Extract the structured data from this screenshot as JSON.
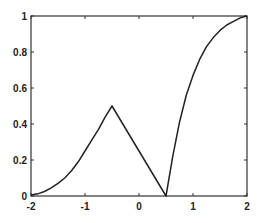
{
  "chart_data": {
    "type": "line",
    "title": "",
    "xlabel": "",
    "ylabel": "",
    "xlim": [
      -2,
      2
    ],
    "ylim": [
      0,
      1
    ],
    "grid": false,
    "legend": null,
    "x_ticks": [
      "-2",
      "-1",
      "0",
      "1",
      "2"
    ],
    "y_ticks": [
      "0",
      "0.2",
      "0.4",
      "0.6",
      "0.8",
      "1"
    ],
    "series": [
      {
        "name": "curve",
        "color": "#222222",
        "x": [
          -2,
          -1.875,
          -1.75,
          -1.625,
          -1.5,
          -1.375,
          -1.25,
          -1.125,
          -1,
          -0.875,
          -0.75,
          -0.625,
          -0.5,
          0.5,
          0.625,
          0.75,
          0.875,
          1,
          1.125,
          1.25,
          1.375,
          1.5,
          1.625,
          1.75,
          1.875,
          2
        ],
        "y": [
          0.005,
          0.012,
          0.025,
          0.045,
          0.07,
          0.1,
          0.14,
          0.19,
          0.25,
          0.31,
          0.37,
          0.44,
          0.5,
          0.0,
          0.22,
          0.41,
          0.56,
          0.67,
          0.76,
          0.83,
          0.88,
          0.92,
          0.95,
          0.97,
          0.99,
          1.0
        ]
      }
    ]
  }
}
